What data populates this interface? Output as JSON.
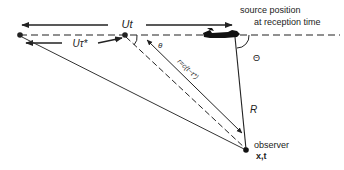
{
  "diagram": {
    "labels": {
      "ut": "Ut",
      "u_tau_star": "Uτ*",
      "source_position_line1": "source position",
      "source_position_line2": "at reception time",
      "theta_small": "θ",
      "theta_large": "Θ",
      "r_equation": "r=c(t−τ*)",
      "R": "R",
      "observer": "observer",
      "observer_coords": "x,t"
    },
    "colors": {
      "ink": "#222222",
      "background": "#ffffff"
    }
  }
}
